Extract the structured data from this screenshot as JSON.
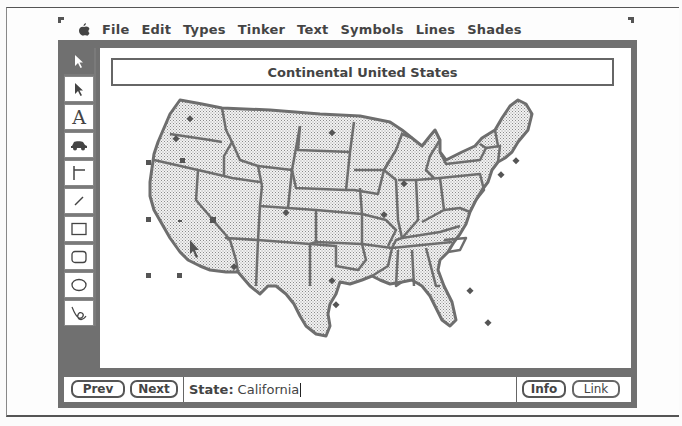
{
  "menubar": {
    "apple_icon": "apple-icon",
    "items": [
      "File",
      "Edit",
      "Types",
      "Tinker",
      "Text",
      "Symbols",
      "Lines",
      "Shades"
    ]
  },
  "toolbar": {
    "tools": [
      {
        "name": "select-arrow",
        "icon": "arrow-icon",
        "active": true
      },
      {
        "name": "pointer",
        "icon": "pointer-icon"
      },
      {
        "name": "text",
        "icon": "text-icon",
        "glyph": "A"
      },
      {
        "name": "car-symbol",
        "icon": "car-icon"
      },
      {
        "name": "connector-line",
        "icon": "connector-icon"
      },
      {
        "name": "line",
        "icon": "line-icon"
      },
      {
        "name": "rectangle",
        "icon": "rectangle-icon"
      },
      {
        "name": "rounded-rectangle",
        "icon": "rounded-rectangle-icon"
      },
      {
        "name": "oval",
        "icon": "oval-icon"
      },
      {
        "name": "freehand",
        "icon": "freehand-icon"
      }
    ]
  },
  "canvas": {
    "title": "Continental United States",
    "map": "map-of-continental-united-states",
    "selected_state": "California",
    "fill_pattern": "dotted-gray",
    "outline_color": "#6e6e6e"
  },
  "bottombar": {
    "prev_label": "Prev",
    "next_label": "Next",
    "field_label": "State:",
    "field_value": "California",
    "info_label": "Info",
    "link_label": "Link"
  },
  "colors": {
    "frame_gray": "#707070",
    "canvas": "#ffffff",
    "text": "#444444"
  }
}
